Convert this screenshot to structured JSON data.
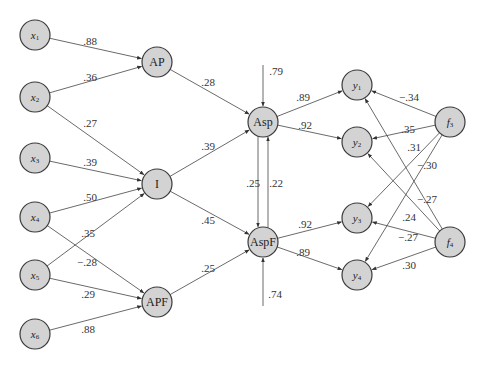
{
  "diagram": {
    "type": "path-diagram",
    "nodes": [
      {
        "id": "x1",
        "label": "x",
        "sub": "1",
        "italic": true
      },
      {
        "id": "x2",
        "label": "x",
        "sub": "2",
        "italic": true
      },
      {
        "id": "x3",
        "label": "x",
        "sub": "3",
        "italic": true
      },
      {
        "id": "x4",
        "label": "x",
        "sub": "4",
        "italic": true
      },
      {
        "id": "x5",
        "label": "x",
        "sub": "5",
        "italic": true
      },
      {
        "id": "x6",
        "label": "x",
        "sub": "6",
        "italic": true
      },
      {
        "id": "AP",
        "label": "AP",
        "sub": "",
        "italic": false
      },
      {
        "id": "I",
        "label": "I",
        "sub": "",
        "italic": false
      },
      {
        "id": "APF",
        "label": "APF",
        "sub": "",
        "italic": false
      },
      {
        "id": "Asp",
        "label": "Asp",
        "sub": "",
        "italic": false
      },
      {
        "id": "AspF",
        "label": "AspF",
        "sub": "",
        "italic": false
      },
      {
        "id": "y1",
        "label": "y",
        "sub": "1",
        "italic": true
      },
      {
        "id": "y2",
        "label": "y",
        "sub": "2",
        "italic": true
      },
      {
        "id": "y3",
        "label": "y",
        "sub": "3",
        "italic": true
      },
      {
        "id": "y4",
        "label": "y",
        "sub": "4",
        "italic": true
      },
      {
        "id": "f3",
        "label": "f",
        "sub": "3",
        "italic": true
      },
      {
        "id": "f4",
        "label": "f",
        "sub": "4",
        "italic": true
      }
    ],
    "edges": [
      {
        "from": "x1",
        "to": "AP",
        "coef": ".88"
      },
      {
        "from": "x2",
        "to": "AP",
        "coef": ".36"
      },
      {
        "from": "x2",
        "to": "I",
        "coef": ".27"
      },
      {
        "from": "x3",
        "to": "I",
        "coef": ".39"
      },
      {
        "from": "x4",
        "to": "I",
        "coef": ".50"
      },
      {
        "from": "x4",
        "to": "APF",
        "coef": "−.28"
      },
      {
        "from": "x5",
        "to": "I",
        "coef": ".35"
      },
      {
        "from": "x5",
        "to": "APF",
        "coef": ".29"
      },
      {
        "from": "x6",
        "to": "APF",
        "coef": ".88"
      },
      {
        "from": "AP",
        "to": "Asp",
        "coef": ".28"
      },
      {
        "from": "I",
        "to": "Asp",
        "coef": ".39"
      },
      {
        "from": "I",
        "to": "AspF",
        "coef": ".45"
      },
      {
        "from": "APF",
        "to": "AspF",
        "coef": ".25"
      },
      {
        "from": "Asp",
        "to": "AspF",
        "coef": ".25"
      },
      {
        "from": "AspF",
        "to": "Asp",
        "coef": ".22"
      },
      {
        "from": "Asp",
        "to": "y1",
        "coef": ".89"
      },
      {
        "from": "Asp",
        "to": "y2",
        "coef": ".92"
      },
      {
        "from": "AspF",
        "to": "y3",
        "coef": ".92"
      },
      {
        "from": "AspF",
        "to": "y4",
        "coef": ".89"
      },
      {
        "from": "f3",
        "to": "y1",
        "coef": "−.34"
      },
      {
        "from": "f3",
        "to": "y2",
        "coef": ".35"
      },
      {
        "from": "f3",
        "to": "y3",
        "coef": ".31"
      },
      {
        "from": "f3",
        "to": "y4",
        "coef": "−.30"
      },
      {
        "from": "f4",
        "to": "y1",
        "coef": "−.27"
      },
      {
        "from": "f4",
        "to": "y2",
        "coef": ".24"
      },
      {
        "from": "f4",
        "to": "y3",
        "coef": "−.27"
      },
      {
        "from": "f4",
        "to": "y4",
        "coef": ".30"
      }
    ],
    "disturbances": [
      {
        "to": "Asp",
        "coef": ".79"
      },
      {
        "to": "AspF",
        "coef": ".74"
      }
    ]
  }
}
